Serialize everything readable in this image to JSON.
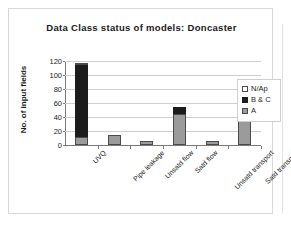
{
  "chart_data": {
    "type": "bar",
    "subtype": "stacked-column",
    "title": "Data Class status of models: Doncaster",
    "xlabel": "",
    "ylabel": "No. of input fields",
    "ylim": [
      0,
      120
    ],
    "ytick_step": 20,
    "ytick_labels": [
      "0",
      "20",
      "40",
      "60",
      "80",
      "100",
      "120"
    ],
    "ytick_values": [
      0,
      20,
      40,
      60,
      80,
      100,
      120
    ],
    "grid": true,
    "grid_axis": "y",
    "legend_position": "right",
    "categories": [
      "UVQ",
      "Pipe leakage",
      "Unsatd flow",
      "Satd flow",
      "Unsatd transport",
      "Satd transport"
    ],
    "series": [
      {
        "name": "A",
        "color": "#9b9b9b",
        "values": [
          11,
          15,
          6,
          44,
          6,
          40
        ]
      },
      {
        "name": "B & C",
        "color": "#1c1c1c",
        "values": [
          104,
          0,
          0,
          10,
          0,
          24
        ]
      },
      {
        "name": "N/Ap",
        "color": "#ffffff",
        "values": [
          2,
          0,
          0,
          0,
          0,
          0
        ]
      }
    ],
    "totals": [
      117,
      15,
      6,
      54,
      6,
      64
    ],
    "legend_entries": [
      {
        "label": "N/Ap",
        "color": "#ffffff"
      },
      {
        "label": "B & C",
        "color": "#1c1c1c"
      },
      {
        "label": "A",
        "color": "#9b9b9b"
      }
    ]
  },
  "colors": {
    "series_a": "#9b9b9b",
    "series_bc": "#1c1c1c",
    "series_nap": "#ffffff",
    "gridline": "#cfcfcf",
    "axis": "#7a7a7a",
    "frame": "#d8d8d8",
    "text": "#1a1a1a"
  }
}
